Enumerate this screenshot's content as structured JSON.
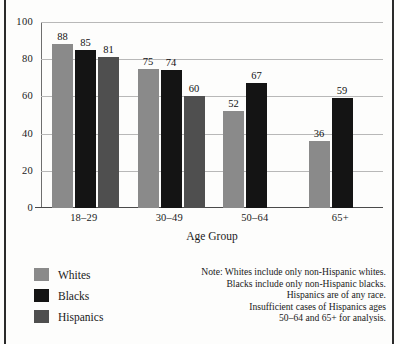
{
  "chart_data": {
    "type": "bar",
    "title": "",
    "xlabel": "Age Group",
    "ylabel": "",
    "categories": [
      "18–29",
      "30–49",
      "50–64",
      "65+"
    ],
    "series": [
      {
        "name": "Whites",
        "color": "#8a8a8a",
        "values": [
          88,
          85,
          52,
          36
        ]
      },
      {
        "name": "Blacks",
        "color": "#141414",
        "values": [
          85,
          74,
          67,
          59
        ]
      },
      {
        "name": "Hispanics",
        "color": "#4f4f4f",
        "values": [
          81,
          60,
          null,
          null
        ]
      }
    ],
    "groups": [
      {
        "category": "18–29",
        "bars": [
          {
            "series": "Whites",
            "value": 88
          },
          {
            "series": "Blacks",
            "value": 85
          },
          {
            "series": "Hispanics",
            "value": 81
          }
        ]
      },
      {
        "category": "30–49",
        "bars": [
          {
            "series": "Whites",
            "value": 75
          },
          {
            "series": "Blacks",
            "value": 74
          },
          {
            "series": "Hispanics",
            "value": 60
          }
        ]
      },
      {
        "category": "50–64",
        "bars": [
          {
            "series": "Whites",
            "value": 52
          },
          {
            "series": "Blacks",
            "value": 67
          }
        ]
      },
      {
        "category": "65+",
        "bars": [
          {
            "series": "Whites",
            "value": 36
          },
          {
            "series": "Blacks",
            "value": 59
          }
        ]
      }
    ],
    "ylim": [
      0,
      100
    ],
    "yticks": [
      0,
      20,
      40,
      60,
      80,
      100
    ],
    "grid": true,
    "legend_position": "bottom-left",
    "annotations": [
      "Note: Whites include only non-Hispanic whites.",
      "Blacks include only non-Hispanic blacks.",
      "Hispanics are of any race.",
      "Insufficient cases of Hispanics ages",
      "50–64 and 65+ for analysis."
    ]
  },
  "legend": {
    "items": [
      {
        "label": "Whites",
        "color": "#8a8a8a"
      },
      {
        "label": "Blacks",
        "color": "#141414"
      },
      {
        "label": "Hispanics",
        "color": "#4f4f4f"
      }
    ]
  },
  "note": {
    "lines": [
      "Note: Whites include only non-Hispanic whites.",
      "Blacks include only non-Hispanic blacks.",
      "Hispanics are of any race.",
      "Insufficient cases of Hispanics ages",
      "50–64 and 65+ for analysis."
    ]
  }
}
